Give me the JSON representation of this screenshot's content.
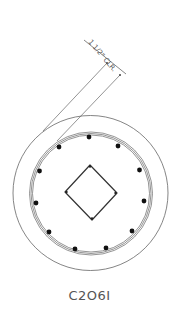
{
  "drawing": {
    "section_label": "C2O6I",
    "dimension_text": "1 1/2\" CLR.",
    "colors": {
      "line": "#666666",
      "bar": "#111111",
      "text": "#555555",
      "background": "#ffffff"
    },
    "outer_circle": {
      "cx": 90.5,
      "cy": 193,
      "r": 77.5
    },
    "cage_rings": [
      {
        "cx": 91,
        "cy": 193.5,
        "r": 61.5
      },
      {
        "cx": 91,
        "cy": 193.5,
        "r": 60
      },
      {
        "cx": 91,
        "cy": 193.5,
        "r": 58.5
      }
    ],
    "longitudinal_bars": [
      {
        "x": 89,
        "y": 137
      },
      {
        "x": 59,
        "y": 147
      },
      {
        "x": 118,
        "y": 146
      },
      {
        "x": 39.5,
        "y": 171
      },
      {
        "x": 139.5,
        "y": 170
      },
      {
        "x": 36,
        "y": 203
      },
      {
        "x": 144,
        "y": 201
      },
      {
        "x": 49,
        "y": 232
      },
      {
        "x": 132,
        "y": 231
      },
      {
        "x": 75,
        "y": 249
      },
      {
        "x": 106,
        "y": 248
      }
    ],
    "tie_diamond": {
      "top": {
        "x": 90,
        "y": 165
      },
      "right": {
        "x": 117,
        "y": 193
      },
      "bottom": {
        "x": 92,
        "y": 220
      },
      "left": {
        "x": 65,
        "y": 192
      }
    },
    "leader_lines": [
      {
        "x1": 107,
        "y1": 63,
        "x2": 43,
        "y2": 131
      },
      {
        "x1": 120,
        "y1": 75,
        "x2": 57,
        "y2": 141
      }
    ],
    "dimension_line": {
      "x1": 84,
      "y1": 40,
      "x2": 126,
      "y2": 74
    }
  }
}
